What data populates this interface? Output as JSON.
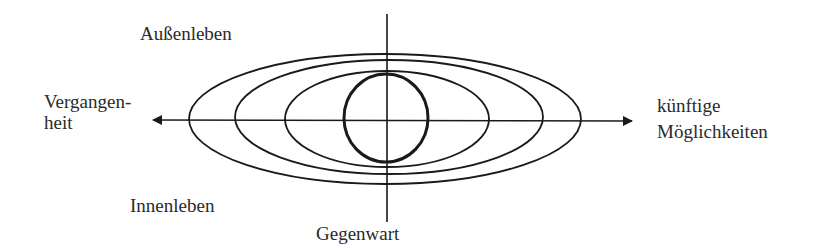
{
  "diagram": {
    "labels": {
      "top_left": "Außenleben",
      "left_line1": "Vergangen-",
      "left_line2": "heit",
      "right_line1": "künftige",
      "right_line2": "Möglichkeiten",
      "bottom_left": "Innenleben",
      "bottom": "Gegenwart"
    },
    "ellipses": [
      "outer",
      "second",
      "third",
      "inner-circle"
    ],
    "axes": {
      "horizontal": "time axis (past ← → future possibilities)",
      "vertical": "present (Gegenwart), dividing outer and inner life"
    },
    "stroke_color": "#1a1a1a"
  }
}
